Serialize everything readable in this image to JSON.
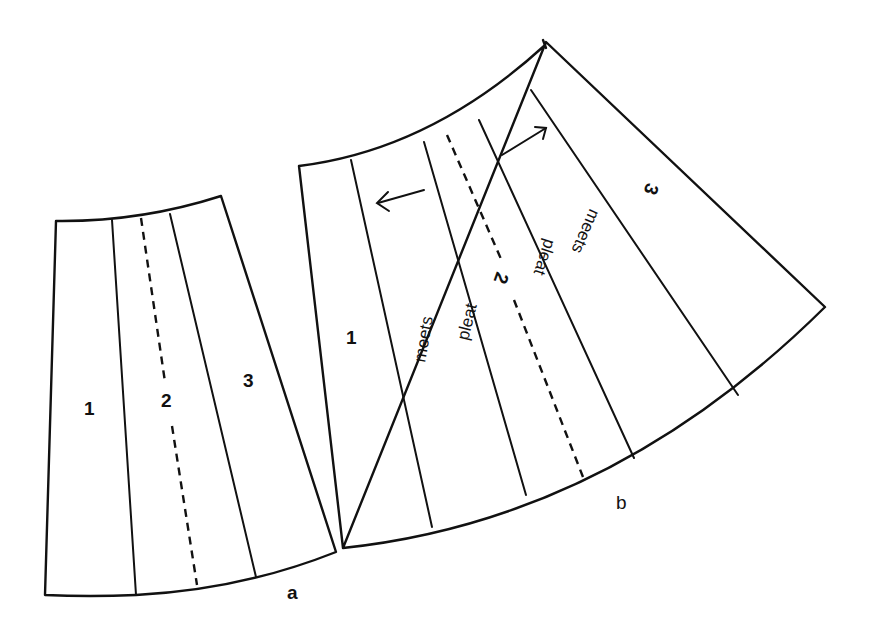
{
  "figure_a": {
    "caption": "a",
    "panels": [
      "1",
      "2",
      "3"
    ]
  },
  "figure_b": {
    "caption": "b",
    "panels": [
      "1",
      "2",
      "3"
    ],
    "annotations": {
      "left_meets": "meets",
      "left_pleat": "pleat",
      "right_pleat": "pleat",
      "right_meets": "meets"
    },
    "arrows": [
      "arrow-left",
      "arrow-right"
    ]
  },
  "colors": {
    "line": "#111111",
    "background": "#ffffff"
  }
}
